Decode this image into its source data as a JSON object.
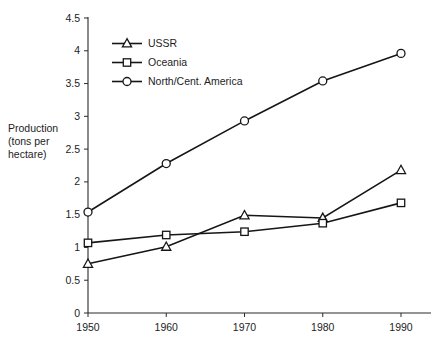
{
  "chart_data": {
    "type": "line",
    "title": "",
    "subtitle": "",
    "xlabel": "",
    "ylabel": "Production (tons per hectare)",
    "ylabel_lines": [
      "Production",
      "(tons per",
      "hectare)"
    ],
    "x": [
      1950,
      1960,
      1970,
      1980,
      1990
    ],
    "categories": [
      "1950",
      "1960",
      "1970",
      "1980",
      "1990"
    ],
    "xtick_labels": [
      "1950",
      "1960",
      "1970",
      "1980",
      "1990"
    ],
    "ytick_labels": [
      "0",
      "0.5",
      "1",
      "1.5",
      "2",
      "2.5",
      "3",
      "3.5",
      "4",
      "4.5"
    ],
    "ytick_values": [
      0,
      0.5,
      1,
      1.5,
      2,
      2.5,
      3,
      3.5,
      4,
      4.5
    ],
    "ylim": [
      0,
      4.5
    ],
    "xlim": [
      1945,
      1995
    ],
    "grid": false,
    "legend_position": "upper-left-inside",
    "series": [
      {
        "name": "USSR",
        "marker": "triangle",
        "values": [
          0.75,
          1.01,
          1.49,
          1.45,
          2.18
        ]
      },
      {
        "name": "Oceania",
        "marker": "square",
        "values": [
          1.07,
          1.19,
          1.24,
          1.37,
          1.68
        ]
      },
      {
        "name": "North/Cent. America",
        "marker": "circle",
        "values": [
          1.54,
          2.28,
          2.93,
          3.54,
          3.96
        ]
      }
    ],
    "colors": {
      "line": "#161616",
      "marker_fill": "#ffffff",
      "axis": "#2b2b2b",
      "text": "#1d1d1d",
      "background": "#ffffff"
    }
  },
  "legend": {
    "entries": [
      {
        "label": "USSR",
        "marker": "triangle"
      },
      {
        "label": "Oceania",
        "marker": "square"
      },
      {
        "label": "North/Cent. America",
        "marker": "circle"
      }
    ]
  }
}
